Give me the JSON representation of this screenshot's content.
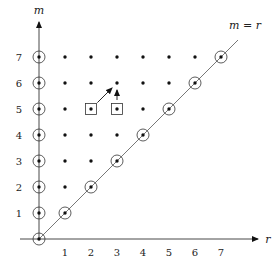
{
  "diagram": {
    "x_axis_label": "r",
    "y_axis_label": "m",
    "diagonal_label": "m = r",
    "x_ticks": [
      "1",
      "2",
      "3",
      "4",
      "5",
      "6",
      "7"
    ],
    "y_ticks": [
      "1",
      "2",
      "3",
      "4",
      "5",
      "6",
      "7"
    ],
    "max_index": 7,
    "boxed_points": [
      [
        2,
        5
      ],
      [
        3,
        5
      ]
    ],
    "arrows": [
      {
        "from": [
          2,
          5
        ],
        "to": [
          3,
          6
        ]
      },
      {
        "from": [
          3,
          5
        ],
        "to": [
          3,
          6
        ]
      }
    ],
    "circled_rule": "points with r = 0 or r = m",
    "grid_rule": "points with 0 <= r <= m <= 7"
  }
}
